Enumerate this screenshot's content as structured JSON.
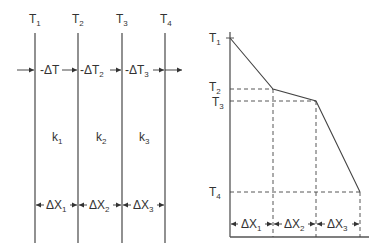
{
  "left_diagram": {
    "temperatures": [
      {
        "label": "T",
        "sub": "1"
      },
      {
        "label": "T",
        "sub": "2"
      },
      {
        "label": "T",
        "sub": "3"
      },
      {
        "label": "T",
        "sub": "4"
      }
    ],
    "deltas_T": [
      {
        "label": "-ΔT",
        "sub": ""
      },
      {
        "label": "-ΔT",
        "sub": "2"
      },
      {
        "label": "-ΔT",
        "sub": "3"
      }
    ],
    "conductivities": [
      {
        "label": "k",
        "sub": "1"
      },
      {
        "label": "k",
        "sub": "2"
      },
      {
        "label": "k",
        "sub": "3"
      }
    ],
    "thicknesses": [
      {
        "label": "ΔX",
        "sub": "1"
      },
      {
        "label": "ΔX",
        "sub": "2"
      },
      {
        "label": "ΔX",
        "sub": "3"
      }
    ]
  },
  "right_diagram": {
    "y_labels": [
      {
        "label": "T",
        "sub": "1"
      },
      {
        "label": "T",
        "sub": "2"
      },
      {
        "label": "T",
        "sub": "3"
      },
      {
        "label": "T",
        "sub": "4"
      }
    ],
    "thicknesses": [
      {
        "label": "ΔX",
        "sub": "1"
      },
      {
        "label": "ΔX",
        "sub": "2"
      },
      {
        "label": "ΔX",
        "sub": "3"
      }
    ]
  },
  "colors": {
    "line": "#444444",
    "text": "#333333"
  }
}
